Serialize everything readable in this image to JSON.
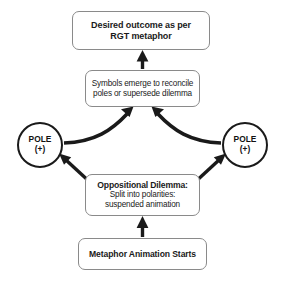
{
  "diagram": {
    "type": "flow-diagram",
    "background_color": "#ffffff",
    "box_border_color": "#8a8a8a",
    "arrow_color": "#1a1a1a",
    "text_color": "#1a1a1a",
    "nodes": {
      "desired_outcome": {
        "line1": "Desired outcome as per",
        "line2": "RGT metaphor"
      },
      "symbols_emerge": {
        "line1": "Symbols emerge to reconcile",
        "line2": "poles or supersede dilemma"
      },
      "pole_left": {
        "label": "POLE",
        "sign": "(+)"
      },
      "pole_right": {
        "label": "POLE",
        "sign": "(+)"
      },
      "oppositional_dilemma": {
        "line1": "Oppositional Dilemma:",
        "line2": "Split into polarities:",
        "line3": "suspended animation"
      },
      "metaphor_start": {
        "line1": "Metaphor Animation Starts"
      }
    },
    "edges": [
      {
        "name": "symbols-to-outcome",
        "from": "symbols_emerge",
        "to": "desired_outcome",
        "style": "straight-vertical-arrow"
      },
      {
        "name": "pole-left-to-symbols",
        "from": "pole_left",
        "to": "symbols_emerge",
        "style": "curved-arrow"
      },
      {
        "name": "pole-right-to-symbols",
        "from": "pole_right",
        "to": "symbols_emerge",
        "style": "curved-arrow"
      },
      {
        "name": "dilemma-to-pole-left",
        "from": "oppositional_dilemma",
        "to": "pole_left",
        "style": "straight-diagonal-arrow"
      },
      {
        "name": "dilemma-to-pole-right",
        "from": "oppositional_dilemma",
        "to": "pole_right",
        "style": "straight-diagonal-arrow"
      },
      {
        "name": "metaphor-start-to-dilemma",
        "from": "metaphor_start",
        "to": "oppositional_dilemma",
        "style": "straight-vertical-arrow"
      }
    ]
  }
}
